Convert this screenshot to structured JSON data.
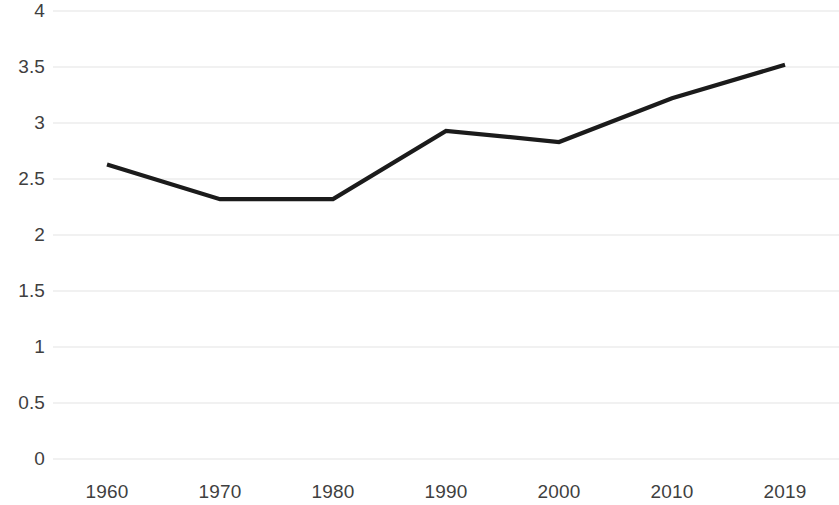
{
  "chart_data": {
    "type": "line",
    "title": "",
    "subtitle": "",
    "xlabel": "",
    "ylabel": "",
    "categories": [
      "1960",
      "1970",
      "1980",
      "1990",
      "2000",
      "2010",
      "2019"
    ],
    "x": [
      1960,
      1970,
      1980,
      1990,
      2000,
      2010,
      2019
    ],
    "values": [
      2.63,
      2.32,
      2.32,
      2.93,
      2.83,
      3.22,
      3.52
    ],
    "series": [
      {
        "name": "",
        "values": [
          2.63,
          2.32,
          2.32,
          2.93,
          2.83,
          3.22,
          3.52
        ],
        "color": "#1b1b1b"
      }
    ],
    "ylim": [
      0,
      4
    ],
    "ytick_values": [
      4,
      3.5,
      3,
      2.5,
      2,
      1.5,
      1,
      0.5,
      0
    ],
    "ytick_labels": [
      "4",
      "3.5",
      "3",
      "2.5",
      "2",
      "1.5",
      "1",
      "0.5",
      "0"
    ],
    "xtick_labels": [
      "1960",
      "1970",
      "1980",
      "1990",
      "2000",
      "2010",
      "2019"
    ],
    "grid": true,
    "grid_axis": "y",
    "grid_color": "#f1f1f1",
    "legend": false,
    "legend_position": "none",
    "annotations": [],
    "background_color": "#ffffff",
    "label_color": "#3f3f3f"
  }
}
